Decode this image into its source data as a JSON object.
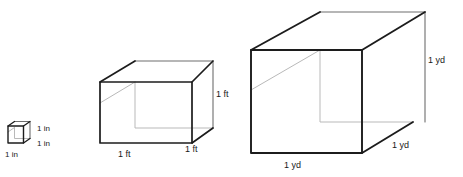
{
  "figure": {
    "background_color": "#ffffff",
    "edge_color": "#1c1c1c",
    "hidden_edge_color": "#b9b9b9",
    "back_edge_color": "#6e6e6e",
    "text_color": "#1a1a1a",
    "cubes": [
      {
        "id": "cubic-inch",
        "name": "small-cube",
        "unit": "in",
        "size_value": "1",
        "height_label": "1 in",
        "width_label": "1 in",
        "depth_label": "1 in"
      },
      {
        "id": "cubic-foot",
        "name": "medium-cube",
        "unit": "ft",
        "size_value": "1",
        "height_label": "1 ft",
        "width_label": "1 ft",
        "depth_label": "1 ft"
      },
      {
        "id": "cubic-yard",
        "name": "large-cube",
        "unit": "yd",
        "size_value": "1",
        "height_label": "1 yd",
        "width_label": "1 yd",
        "depth_label": "1 yd"
      }
    ]
  }
}
